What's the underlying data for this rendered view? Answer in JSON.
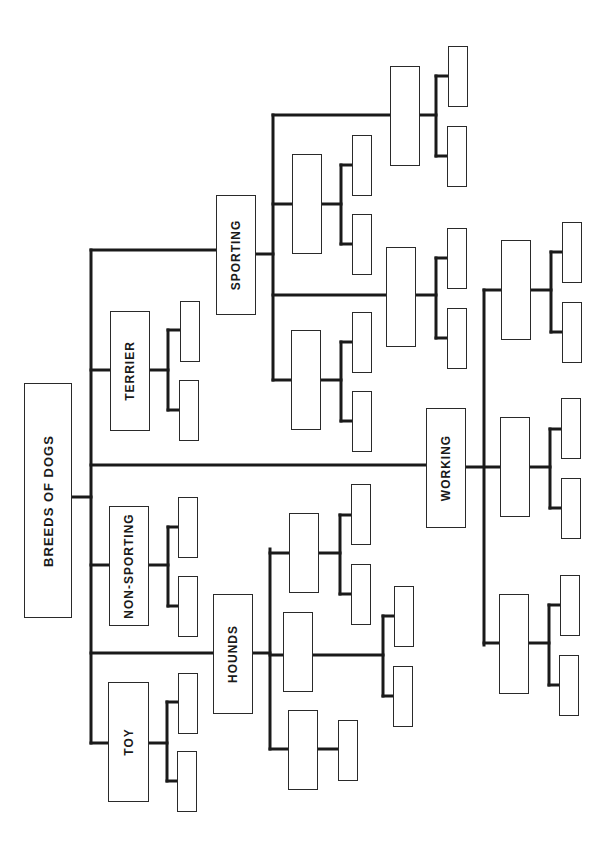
{
  "diagram": {
    "title": "BREEDS OF DOGS",
    "type": "tree / organization chart (rotated 90°)",
    "line_color": "#1a1a1a",
    "box_border_color": "#2a2a2a",
    "root": {
      "label": "BREEDS OF DOGS"
    },
    "groups": [
      {
        "label": "TOY"
      },
      {
        "label": "NON-SPORTING"
      },
      {
        "label": "TERRIER"
      },
      {
        "label": "SPORTING"
      },
      {
        "label": "HOUNDS"
      },
      {
        "label": "WORKING"
      }
    ],
    "boxes": [
      {
        "id": "root",
        "x": 24,
        "y": 383,
        "w": 48,
        "h": 235,
        "label": "BREEDS OF DOGS",
        "big": true
      },
      {
        "id": "toy",
        "x": 108,
        "y": 682,
        "w": 41,
        "h": 120,
        "label": "TOY"
      },
      {
        "id": "toy-c1",
        "x": 178,
        "y": 673,
        "w": 20,
        "h": 61
      },
      {
        "id": "toy-c2",
        "x": 177,
        "y": 751,
        "w": 20,
        "h": 61
      },
      {
        "id": "nonsporting",
        "x": 109,
        "y": 506,
        "w": 40,
        "h": 120,
        "label": "NON-SPORTING"
      },
      {
        "id": "ns-c1",
        "x": 178,
        "y": 497,
        "w": 20,
        "h": 61
      },
      {
        "id": "ns-c2",
        "x": 178,
        "y": 576,
        "w": 20,
        "h": 61
      },
      {
        "id": "terrier",
        "x": 110,
        "y": 311,
        "w": 40,
        "h": 120,
        "label": "TERRIER"
      },
      {
        "id": "ter-c1",
        "x": 180,
        "y": 301,
        "w": 20,
        "h": 61
      },
      {
        "id": "ter-c2",
        "x": 179,
        "y": 380,
        "w": 20,
        "h": 61
      },
      {
        "id": "hounds",
        "x": 213,
        "y": 594,
        "w": 40,
        "h": 120,
        "label": "HOUNDS"
      },
      {
        "id": "h-a",
        "x": 289,
        "y": 513,
        "w": 30,
        "h": 80
      },
      {
        "id": "h-a1",
        "x": 351,
        "y": 484,
        "w": 20,
        "h": 61
      },
      {
        "id": "h-a2",
        "x": 351,
        "y": 564,
        "w": 20,
        "h": 61
      },
      {
        "id": "h-b",
        "x": 283,
        "y": 612,
        "w": 30,
        "h": 80
      },
      {
        "id": "h-b1",
        "x": 394,
        "y": 586,
        "w": 20,
        "h": 61
      },
      {
        "id": "h-b2",
        "x": 393,
        "y": 666,
        "w": 20,
        "h": 61
      },
      {
        "id": "h-c",
        "x": 288,
        "y": 710,
        "w": 30,
        "h": 80
      },
      {
        "id": "h-c1",
        "x": 338,
        "y": 720,
        "w": 20,
        "h": 61
      },
      {
        "id": "sporting",
        "x": 216,
        "y": 195,
        "w": 40,
        "h": 120,
        "label": "SPORTING"
      },
      {
        "id": "s-a",
        "x": 292,
        "y": 154,
        "w": 30,
        "h": 100
      },
      {
        "id": "s-a1",
        "x": 352,
        "y": 135,
        "w": 20,
        "h": 61
      },
      {
        "id": "s-a2",
        "x": 352,
        "y": 214,
        "w": 20,
        "h": 61
      },
      {
        "id": "s-b",
        "x": 390,
        "y": 66,
        "w": 30,
        "h": 100
      },
      {
        "id": "s-b1",
        "x": 448,
        "y": 46,
        "w": 20,
        "h": 61
      },
      {
        "id": "s-b2",
        "x": 447,
        "y": 126,
        "w": 20,
        "h": 61
      },
      {
        "id": "s-c",
        "x": 291,
        "y": 330,
        "w": 30,
        "h": 100
      },
      {
        "id": "s-c1",
        "x": 352,
        "y": 312,
        "w": 20,
        "h": 61
      },
      {
        "id": "s-c2",
        "x": 352,
        "y": 391,
        "w": 20,
        "h": 61
      },
      {
        "id": "s-d",
        "x": 386,
        "y": 247,
        "w": 30,
        "h": 100
      },
      {
        "id": "s-d1",
        "x": 447,
        "y": 228,
        "w": 20,
        "h": 61
      },
      {
        "id": "s-d2",
        "x": 447,
        "y": 308,
        "w": 20,
        "h": 61
      },
      {
        "id": "working",
        "x": 426,
        "y": 408,
        "w": 40,
        "h": 120,
        "label": "WORKING"
      },
      {
        "id": "w-a",
        "x": 501,
        "y": 240,
        "w": 30,
        "h": 100
      },
      {
        "id": "w-a1",
        "x": 562,
        "y": 222,
        "w": 20,
        "h": 61
      },
      {
        "id": "w-a2",
        "x": 562,
        "y": 302,
        "w": 20,
        "h": 61
      },
      {
        "id": "w-b",
        "x": 500,
        "y": 417,
        "w": 30,
        "h": 100
      },
      {
        "id": "w-b1",
        "x": 561,
        "y": 398,
        "w": 20,
        "h": 61
      },
      {
        "id": "w-b2",
        "x": 561,
        "y": 478,
        "w": 20,
        "h": 61
      },
      {
        "id": "w-c",
        "x": 499,
        "y": 594,
        "w": 30,
        "h": 100
      },
      {
        "id": "w-c1",
        "x": 560,
        "y": 575,
        "w": 20,
        "h": 61
      },
      {
        "id": "w-c2",
        "x": 559,
        "y": 655,
        "w": 20,
        "h": 61
      }
    ],
    "lines": [
      [
        72,
        497,
        91,
        497
      ],
      [
        91,
        250,
        91,
        743
      ],
      [
        91,
        743,
        108,
        743
      ],
      [
        149,
        743,
        167,
        743
      ],
      [
        167,
        702,
        167,
        781
      ],
      [
        167,
        702,
        178,
        702
      ],
      [
        167,
        781,
        177,
        781
      ],
      [
        91,
        565,
        109,
        565
      ],
      [
        149,
        565,
        168,
        565
      ],
      [
        168,
        527,
        168,
        606
      ],
      [
        168,
        527,
        178,
        527
      ],
      [
        168,
        606,
        178,
        606
      ],
      [
        91,
        370,
        110,
        370
      ],
      [
        150,
        370,
        168,
        370
      ],
      [
        168,
        330,
        168,
        410
      ],
      [
        168,
        330,
        180,
        330
      ],
      [
        168,
        410,
        179,
        410
      ],
      [
        91,
        653,
        213,
        653
      ],
      [
        253,
        653,
        270,
        653
      ],
      [
        270,
        549,
        270,
        749
      ],
      [
        270,
        553,
        289,
        553
      ],
      [
        319,
        553,
        340,
        553
      ],
      [
        340,
        515,
        340,
        594
      ],
      [
        340,
        515,
        351,
        515
      ],
      [
        340,
        594,
        351,
        594
      ],
      [
        270,
        655,
        283,
        655
      ],
      [
        313,
        655,
        383,
        655
      ],
      [
        383,
        616,
        383,
        696
      ],
      [
        383,
        616,
        394,
        616
      ],
      [
        383,
        696,
        393,
        696
      ],
      [
        270,
        749,
        288,
        749
      ],
      [
        318,
        749,
        338,
        749
      ],
      [
        91,
        250,
        216,
        250
      ],
      [
        256,
        254,
        273,
        254
      ],
      [
        273,
        115,
        273,
        380
      ],
      [
        273,
        204,
        292,
        204
      ],
      [
        322,
        204,
        341,
        204
      ],
      [
        341,
        165,
        341,
        244
      ],
      [
        341,
        165,
        352,
        165
      ],
      [
        341,
        244,
        352,
        244
      ],
      [
        273,
        115,
        390,
        115
      ],
      [
        420,
        115,
        436,
        115
      ],
      [
        436,
        76,
        436,
        156
      ],
      [
        436,
        76,
        448,
        76
      ],
      [
        436,
        156,
        447,
        156
      ],
      [
        273,
        380,
        291,
        380
      ],
      [
        321,
        380,
        341,
        380
      ],
      [
        341,
        342,
        341,
        421
      ],
      [
        341,
        342,
        352,
        342
      ],
      [
        341,
        421,
        352,
        421
      ],
      [
        273,
        295,
        386,
        295
      ],
      [
        416,
        295,
        436,
        295
      ],
      [
        436,
        258,
        436,
        338
      ],
      [
        436,
        258,
        447,
        258
      ],
      [
        436,
        338,
        447,
        338
      ],
      [
        91,
        465,
        426,
        465
      ],
      [
        466,
        467,
        501,
        467
      ],
      [
        484,
        290,
        484,
        645
      ],
      [
        484,
        290,
        501,
        290
      ],
      [
        531,
        290,
        551,
        290
      ],
      [
        551,
        252,
        551,
        332
      ],
      [
        551,
        252,
        562,
        252
      ],
      [
        551,
        332,
        562,
        332
      ],
      [
        530,
        467,
        550,
        467
      ],
      [
        550,
        429,
        550,
        508
      ],
      [
        550,
        429,
        561,
        429
      ],
      [
        550,
        508,
        561,
        508
      ],
      [
        484,
        643,
        499,
        643
      ],
      [
        529,
        643,
        549,
        643
      ],
      [
        549,
        605,
        549,
        685
      ],
      [
        549,
        605,
        560,
        605
      ],
      [
        549,
        685,
        559,
        685
      ]
    ]
  }
}
